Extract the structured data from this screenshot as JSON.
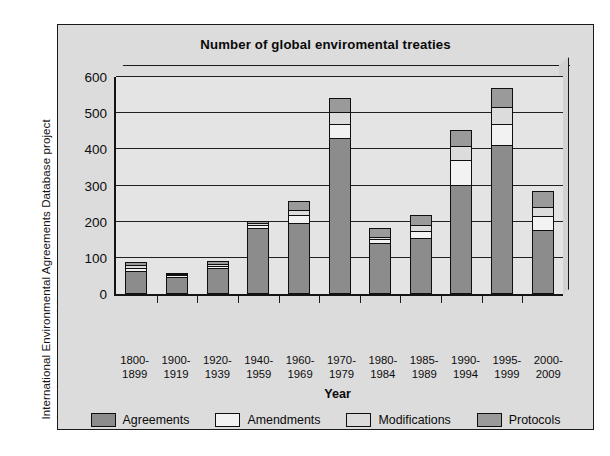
{
  "source_credit": {
    "line1": "International Environmental Agreements Database project",
    "line2": "(www.iea.uoregon.edu)."
  },
  "axis_title_x": "Year",
  "colors": {
    "agreements": "#8c8c8c",
    "amendments": "#f2f2f2",
    "modifications": "#dcdcdc",
    "protocols": "#9a9a9a",
    "frame_bg": "#dcdcdc",
    "plot_bg": "#e4e4e4",
    "axis": "#141414"
  },
  "chart_data": {
    "type": "bar",
    "stacked": true,
    "title": "Number of global enviromental treaties",
    "xlabel": "Year",
    "ylabel": "",
    "ylim": [
      0,
      600
    ],
    "yticks": [
      0,
      100,
      200,
      300,
      400,
      500,
      600
    ],
    "ytick_labels": [
      "0",
      "100",
      "200",
      "300",
      "400",
      "500",
      "600"
    ],
    "grid": true,
    "legend_position": "bottom",
    "categories": [
      "1800-1899",
      "1900-1919",
      "1920-1939",
      "1940-1959",
      "1960-1969",
      "1970-1979",
      "1980-1984",
      "1985-1989",
      "1990-1994",
      "1995-1999",
      "2000-2009"
    ],
    "category_lines": [
      [
        "1800-",
        "1899"
      ],
      [
        "1900-",
        "1919"
      ],
      [
        "1920-",
        "1939"
      ],
      [
        "1940-",
        "1959"
      ],
      [
        "1960-",
        "1969"
      ],
      [
        "1970-",
        "1979"
      ],
      [
        "1980-",
        "1984"
      ],
      [
        "1985-",
        "1989"
      ],
      [
        "1990-",
        "1994"
      ],
      [
        "1995-",
        "1999"
      ],
      [
        "2000-",
        "2009"
      ]
    ],
    "series": [
      {
        "name": "Agreements",
        "color": "#8c8c8c",
        "values": [
          62,
          48,
          70,
          182,
          196,
          430,
          140,
          152,
          300,
          410,
          175
        ]
      },
      {
        "name": "Amendments",
        "color": "#f2f2f2",
        "values": [
          10,
          4,
          8,
          8,
          22,
          38,
          10,
          22,
          70,
          60,
          38
        ]
      },
      {
        "name": "Modifications",
        "color": "#dcdcdc",
        "values": [
          8,
          3,
          6,
          6,
          14,
          34,
          8,
          16,
          40,
          46,
          28
        ]
      },
      {
        "name": "Protocols",
        "color": "#9a9a9a",
        "values": [
          8,
          3,
          8,
          6,
          24,
          40,
          24,
          28,
          44,
          54,
          45
        ]
      }
    ],
    "totals": [
      88,
      58,
      92,
      202,
      256,
      542,
      182,
      218,
      454,
      570,
      286
    ]
  },
  "legend": {
    "items": [
      {
        "label": "Agreements",
        "color": "#8c8c8c"
      },
      {
        "label": "Amendments",
        "color": "#f2f2f2"
      },
      {
        "label": "Modifications",
        "color": "#dcdcdc"
      },
      {
        "label": "Protocols",
        "color": "#9a9a9a"
      }
    ]
  }
}
